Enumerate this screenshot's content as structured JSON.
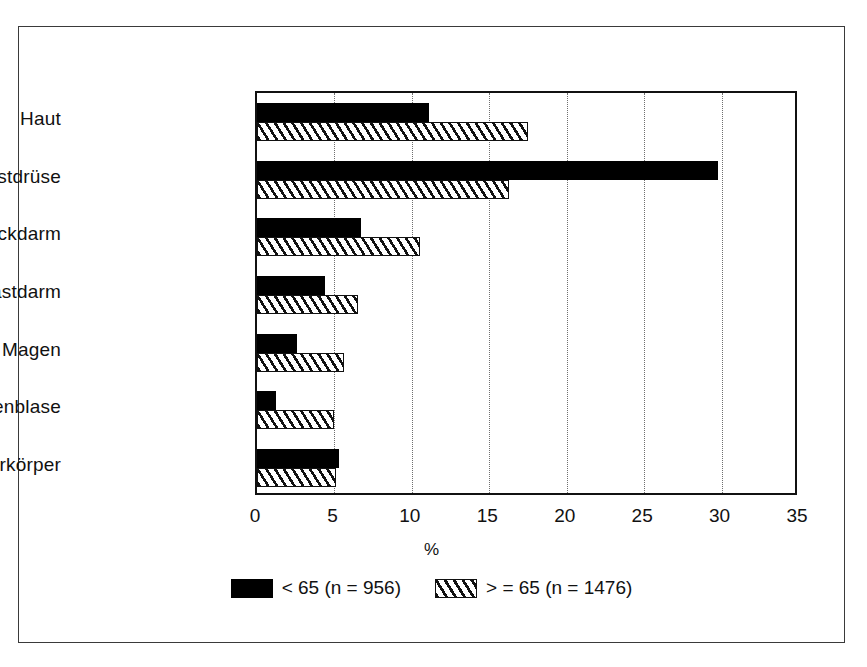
{
  "chart_data": {
    "type": "bar",
    "orientation": "horizontal",
    "title": "",
    "xlabel": "%",
    "ylabel": "",
    "xlim": [
      0,
      35
    ],
    "xticks": [
      0,
      5,
      10,
      15,
      20,
      25,
      30,
      35
    ],
    "xtick_labels": [
      "0",
      "5",
      "10",
      "15",
      "20",
      "25",
      "30",
      "35"
    ],
    "grid": "vertical dotted gridlines at each x tick",
    "legend_position": "bottom-center",
    "categories": [
      "Haut",
      "Brustdrüse",
      "Dickdarm",
      "Mastdarm",
      "Magen",
      "Gallenblase",
      "Gebärmutterkörper"
    ],
    "series": [
      {
        "name": "< 65 (n = 956)",
        "style": "solid-black",
        "color": "#000000",
        "values": [
          11.1,
          29.8,
          6.7,
          4.4,
          2.6,
          1.2,
          5.3
        ]
      },
      {
        "name": "> = 65 (n = 1476)",
        "style": "hatched",
        "color": "#ffffff",
        "values": [
          17.5,
          16.3,
          10.5,
          6.5,
          5.6,
          5.0,
          5.1
        ]
      }
    ],
    "legend": [
      {
        "label": "< 65 (n = 956)",
        "swatch": "solid"
      },
      {
        "label": "> = 65 (n = 1476)",
        "swatch": "hatch"
      }
    ]
  },
  "figure": {
    "border_color": "#3a3a3a",
    "plot_border_color": "#111111",
    "gridline_color": "#6f6f6f",
    "background": "#ffffff"
  }
}
